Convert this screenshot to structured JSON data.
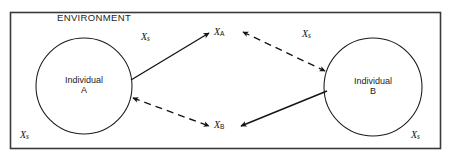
{
  "figure": {
    "domain": "diagram",
    "type": "node-link-diagram",
    "background_color": "#ffffff",
    "border_color": "#3a3a3a",
    "stroke_color": "#141414",
    "width": 452,
    "height": 161
  },
  "environment": {
    "label": "ENVIRONMENT"
  },
  "nodes": {
    "individual_a": {
      "line1": "Individual",
      "line2": "A",
      "shape": "circle",
      "cx": 84,
      "cy": 86,
      "r": 48
    },
    "individual_b": {
      "line1": "Individual",
      "line2": "B",
      "shape": "circle",
      "cx": 373,
      "cy": 87,
      "r": 49
    },
    "x_a": {
      "symbol": "X",
      "subscript": "A"
    },
    "x_b": {
      "symbol": "X",
      "subscript": "B"
    }
  },
  "environment_variables": [
    {
      "id": "xs-top-left",
      "symbol": "X",
      "subscript": "s"
    },
    {
      "id": "xs-top-right",
      "symbol": "X",
      "subscript": "s"
    },
    {
      "id": "xs-bottom-left",
      "symbol": "X",
      "subscript": "s"
    },
    {
      "id": "xs-bottom-right",
      "symbol": "X",
      "subscript": "s"
    }
  ],
  "edges": [
    {
      "id": "edge-a-to-xa",
      "from": "individual_a",
      "to": "x_a",
      "style": "solid",
      "arrowheads": "end",
      "path": "M 131,80 L 209,33"
    },
    {
      "id": "edge-xa-to-b",
      "from": "x_a",
      "to": "individual_b",
      "style": "dashed",
      "arrowheads": "both",
      "path": "M 241,32 L 326,71"
    },
    {
      "id": "edge-a-to-xb",
      "from": "individual_a",
      "to": "x_b",
      "style": "dashed",
      "arrowheads": "both",
      "path": "M 133,98 L 209,126"
    },
    {
      "id": "edge-b-to-xb",
      "from": "individual_b",
      "to": "x_b",
      "style": "solid",
      "arrowheads": "end",
      "path": "M 327,91 L 241,126"
    }
  ]
}
